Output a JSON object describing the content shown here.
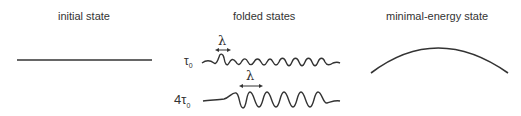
{
  "panels": {
    "initial": {
      "title": "initial state"
    },
    "folded": {
      "title": "folded states",
      "rows": [
        {
          "load_label": "τ",
          "load_sub": "0",
          "wavelength_label": "λ"
        },
        {
          "load_label": "4τ",
          "load_sub": "0",
          "wavelength_label": "λ"
        }
      ]
    },
    "minimal": {
      "title": "minimal-energy state"
    }
  },
  "colors": {
    "line": "#333333",
    "text": "#333333",
    "background": "#ffffff"
  }
}
